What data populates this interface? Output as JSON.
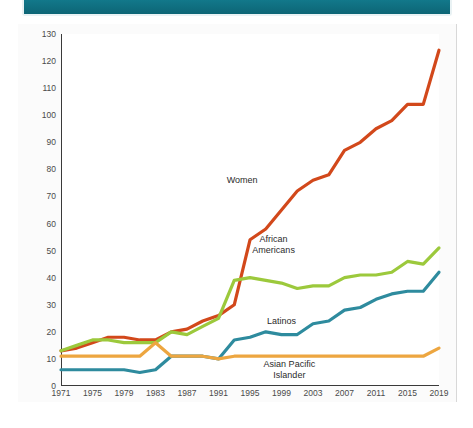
{
  "header": {
    "title": "",
    "color": "#0f6f80"
  },
  "chart_data": {
    "type": "line",
    "title": "",
    "xlabel": "",
    "ylabel": "",
    "xlim": [
      1971,
      2019
    ],
    "ylim": [
      0,
      130
    ],
    "ytick_step": 10,
    "grid": false,
    "legend_position": "inline-labels",
    "x": [
      1971,
      1973,
      1975,
      1977,
      1979,
      1981,
      1983,
      1985,
      1987,
      1989,
      1991,
      1993,
      1995,
      1997,
      1999,
      2001,
      2003,
      2005,
      2007,
      2009,
      2011,
      2013,
      2015,
      2017,
      2019
    ],
    "ytick_labels": [
      "0",
      "10",
      "20",
      "30",
      "40",
      "50",
      "60",
      "70",
      "80",
      "90",
      "100",
      "110",
      "120",
      "130"
    ],
    "xtick_labels": [
      "1971",
      "1975",
      "1979",
      "1983",
      "1987",
      "1991",
      "1995",
      "1999",
      "2003",
      "2007",
      "2011",
      "2015",
      "2019"
    ],
    "series": [
      {
        "name": "Women",
        "color": "#d2481b",
        "label_x": 1994,
        "label_y": 76,
        "values": [
          13,
          14,
          16,
          18,
          18,
          17,
          17,
          20,
          21,
          24,
          26,
          30,
          54,
          58,
          65,
          72,
          76,
          78,
          87,
          90,
          95,
          98,
          104,
          104,
          124
        ]
      },
      {
        "name": "African Americans",
        "color": "#9cc93c",
        "label_x": 1998,
        "label_y": 52,
        "values": [
          13,
          15,
          17,
          17,
          16,
          16,
          16,
          20,
          19,
          22,
          25,
          39,
          40,
          39,
          38,
          36,
          37,
          37,
          40,
          41,
          41,
          42,
          46,
          45,
          51
        ]
      },
      {
        "name": "Latinos",
        "color": "#2e8b9e",
        "label_x": 1999,
        "label_y": 24,
        "values": [
          6,
          6,
          6,
          6,
          6,
          5,
          6,
          11,
          11,
          11,
          10,
          17,
          18,
          20,
          19,
          19,
          23,
          24,
          28,
          29,
          32,
          34,
          35,
          35,
          42
        ]
      },
      {
        "name": "Asian Pacific Islander",
        "color": "#eda640",
        "label_x": 2000,
        "label_y": 6,
        "values": [
          11,
          11,
          11,
          11,
          11,
          11,
          16,
          11,
          11,
          11,
          10,
          11,
          11,
          11,
          11,
          11,
          11,
          11,
          11,
          11,
          11,
          11,
          11,
          11,
          14
        ]
      }
    ]
  }
}
